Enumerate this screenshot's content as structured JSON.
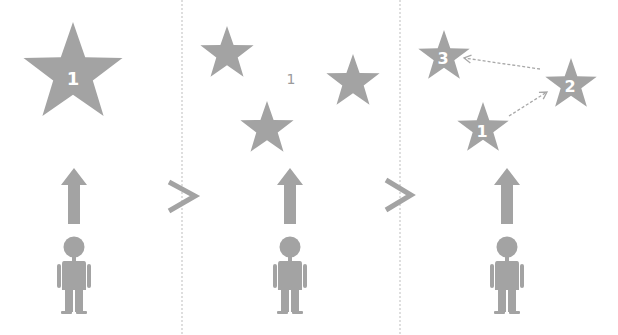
{
  "diagram": {
    "colors": {
      "shape": "#a3a3a3",
      "divider": "#bdbdbd",
      "dashed_arrow": "#a8a8a8",
      "label_on_shape": "#ffffff",
      "floating_label": "#9b9b9b",
      "background": "#ffffff"
    },
    "panels": [
      {
        "name": "single-goal",
        "stars": [
          {
            "label": "1"
          }
        ],
        "floating_label": null,
        "connections": []
      },
      {
        "name": "multiple-unordered-goals",
        "stars": [
          {
            "label": ""
          },
          {
            "label": ""
          },
          {
            "label": ""
          }
        ],
        "floating_label": "1",
        "connections": []
      },
      {
        "name": "ordered-goals",
        "stars": [
          {
            "label": "3"
          },
          {
            "label": "2"
          },
          {
            "label": "1"
          }
        ],
        "floating_label": null,
        "connections": [
          {
            "from": "1",
            "to": "2",
            "style": "dashed-arrow"
          },
          {
            "from": "2",
            "to": "3",
            "style": "dashed-arrow"
          }
        ]
      }
    ],
    "separators": [
      ">",
      ">"
    ],
    "icons": [
      "star-icon",
      "up-arrow-icon",
      "person-icon",
      "chevron-right-icon",
      "dashed-arrow-icon"
    ]
  }
}
